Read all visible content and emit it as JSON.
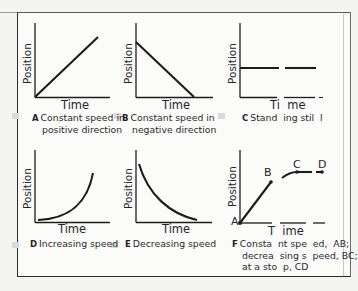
{
  "diagram": {
    "axis_labels": {
      "x": "Time",
      "y": "Position"
    },
    "panels": [
      {
        "id": "A",
        "letter": "A",
        "caption_line1": "Constant speed in",
        "caption_line2": "positive direction",
        "shape": "straight line rising"
      },
      {
        "id": "B",
        "letter": "B",
        "caption_line1": "Constant speed in",
        "caption_line2": "negative direction",
        "shape": "straight line falling"
      },
      {
        "id": "C",
        "letter": "C",
        "caption_line1": "Stand  ing stil  l",
        "caption_line2": "",
        "shape": "horizontal line",
        "x_label": "Ti  me"
      },
      {
        "id": "D",
        "letter": "D",
        "caption_line1": "Increasing speed",
        "caption_line2": "",
        "shape": "curve concave up rising"
      },
      {
        "id": "E",
        "letter": "E",
        "caption_line1": "Decreasing speed",
        "caption_line2": "",
        "shape": "curve concave up falling"
      },
      {
        "id": "F",
        "letter": "F",
        "caption_line1": "Consta  nt spe  ed,  AB;",
        "caption_line2": "decrea  sing s  peed, BC;",
        "caption_line3": "at a sto  p, CD",
        "shape": "piecewise",
        "x_label": "T  ime",
        "points": {
          "A": "A",
          "B": "B",
          "C": "C",
          "D": "D"
        }
      }
    ]
  }
}
